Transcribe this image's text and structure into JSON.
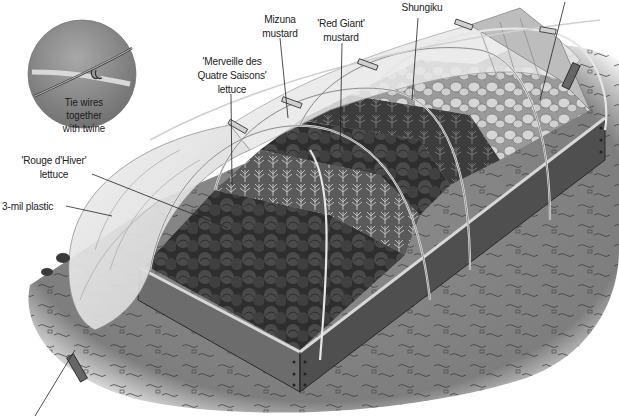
{
  "figure": {
    "inset": {
      "caption_lines": [
        "Tie wires",
        "together",
        "with twine"
      ]
    },
    "callouts": [
      {
        "id": "mizuna",
        "lines": [
          "Mizuna",
          "mustard"
        ]
      },
      {
        "id": "red-giant",
        "lines": [
          "'Red Giant'",
          "mustard"
        ]
      },
      {
        "id": "shungiku",
        "lines": [
          "Shungiku"
        ]
      },
      {
        "id": "merveille",
        "lines": [
          "'Merveille des",
          "Quatre Saisons'",
          "lettuce"
        ]
      },
      {
        "id": "rouge",
        "lines": [
          "'Rouge d'Hiver'",
          "lettuce"
        ]
      },
      {
        "id": "plastic",
        "lines": [
          "3-mil plastic"
        ]
      }
    ],
    "colors": {
      "background": "#ffffff",
      "ground": "#8a8a8a",
      "bed_wood_side": "#6e6e6e",
      "bed_wood_front": "#555555",
      "bed_rim": "#d8d8d8",
      "plastic": "#e4e4e4",
      "dark_lettuce": "#3a3a3a",
      "light_greens": "#c8c8c8",
      "inset_circle": "#8f8f8f",
      "text": "#222222"
    }
  }
}
